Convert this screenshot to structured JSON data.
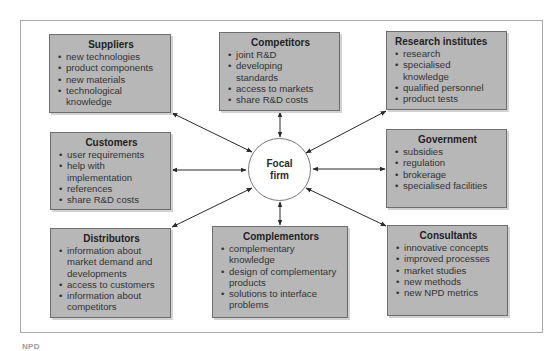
{
  "diagram": {
    "center": {
      "label_line1": "Focal",
      "label_line2": "firm"
    },
    "boxes": {
      "suppliers": {
        "title": "Suppliers",
        "items": [
          "new technologies",
          "product components",
          "new materials",
          "technological knowledge"
        ]
      },
      "competitors": {
        "title": "Competitors",
        "items": [
          "joint R&D",
          "developing standards",
          "access to markets",
          "share R&D costs"
        ]
      },
      "research": {
        "title": "Research institutes",
        "items": [
          "research",
          "specialised knowledge",
          "qualified personnel",
          "product tests"
        ]
      },
      "customers": {
        "title": "Customers",
        "items": [
          "user requirements",
          "help with implementation",
          "references",
          "share R&D costs"
        ]
      },
      "government": {
        "title": "Government",
        "items": [
          "subsidies",
          "regulation",
          "brokerage",
          "specialised facilities"
        ]
      },
      "distributors": {
        "title": "Distributors",
        "items": [
          "information about market demand and developments",
          "access to customers",
          "information about competitors"
        ]
      },
      "complementors": {
        "title": "Complementors",
        "items": [
          "complementary knowledge",
          "design of complementary products",
          "solutions to interface problems"
        ]
      },
      "consultants": {
        "title": "Consultants",
        "items": [
          "innovative concepts",
          "improved processes",
          "market studies",
          "new methods",
          "new NPD metrics"
        ]
      }
    },
    "colors": {
      "box_fill": "#b7b7b7",
      "box_border": "#6e6e6e",
      "arrow": "#2a2a2a",
      "frame": "#a9a9a9"
    }
  },
  "caption": {
    "text": "NPD"
  }
}
